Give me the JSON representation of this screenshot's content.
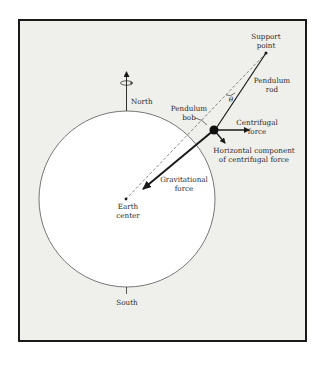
{
  "diagram": {
    "colors": {
      "frame_fill": "#efefec",
      "frame_border": "#1a1a1a",
      "earth_fill": "#ffffff",
      "line": "#1a1a1a"
    },
    "labels": {
      "support_point_1": "Support",
      "support_point_2": "point",
      "pendulum_rod_1": "Pendulum",
      "pendulum_rod_2": "rod",
      "theta": "θ",
      "pendulum_bob_1": "Pendulum",
      "pendulum_bob_2": "bob",
      "centrifugal_1": "Centrifugal",
      "centrifugal_2": "force",
      "horizontal_1": "Horizontal component",
      "horizontal_2": "of centrifugal force",
      "gravitational_1": "Gravitational",
      "gravitational_2": "force",
      "earth_center_1": "Earth",
      "earth_center_2": "center",
      "north": "North",
      "south": "South"
    },
    "icons": {
      "rotation": "rotation-arrow-icon"
    }
  }
}
